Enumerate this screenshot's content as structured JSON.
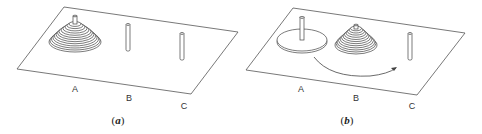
{
  "figure": {
    "line_color": "#555555",
    "panels": [
      {
        "id": "a",
        "caption_letter": "a",
        "caption_open": "(",
        "caption_close": ")",
        "pegs": [
          {
            "label": "A",
            "state": "full stack of disks"
          },
          {
            "label": "B",
            "state": "empty"
          },
          {
            "label": "C",
            "state": "empty"
          }
        ]
      },
      {
        "id": "b",
        "caption_letter": "b",
        "caption_open": "(",
        "caption_close": ")",
        "pegs": [
          {
            "label": "A",
            "state": "largest disk only"
          },
          {
            "label": "B",
            "state": "stack of smaller disks"
          },
          {
            "label": "C",
            "state": "empty"
          }
        ],
        "arrow": {
          "from": "A",
          "to": "C",
          "meaning": "move largest disk"
        }
      }
    ]
  }
}
